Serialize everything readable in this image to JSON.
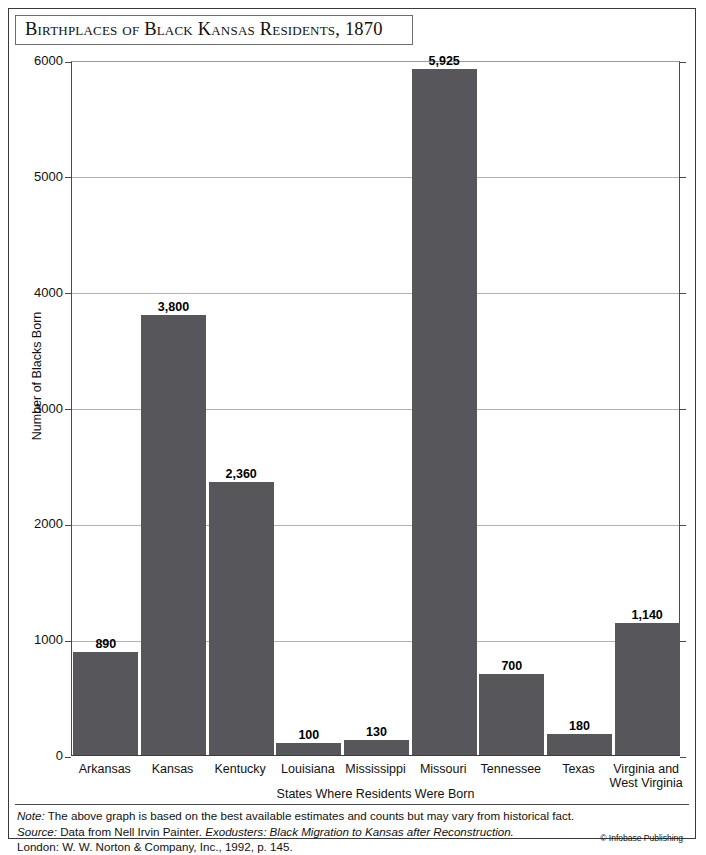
{
  "figure": {
    "title": "Birthplaces of Black Kansas Residents, 1870"
  },
  "chart_data": {
    "type": "bar",
    "title": "Birthplaces of Black Kansas Residents, 1870",
    "xlabel": "States Where Residents Were Born",
    "ylabel": "Number of Blacks Born",
    "categories": [
      "Arkansas",
      "Kansas",
      "Kentucky",
      "Louisiana",
      "Mississippi",
      "Missouri",
      "Tennessee",
      "Texas",
      "Virginia and West Virginia"
    ],
    "values": [
      890,
      3800,
      2360,
      100,
      130,
      5925,
      700,
      180,
      1140
    ],
    "value_labels": [
      "890",
      "3,800",
      "2,360",
      "100",
      "130",
      "5,925",
      "700",
      "180",
      "1,140"
    ],
    "category_lines": [
      [
        "Arkansas"
      ],
      [
        "Kansas"
      ],
      [
        "Kentucky"
      ],
      [
        "Louisiana"
      ],
      [
        "Mississippi"
      ],
      [
        "Missouri"
      ],
      [
        "Tennessee"
      ],
      [
        "Texas"
      ],
      [
        "Virginia and",
        "West Virginia"
      ]
    ],
    "ylim": [
      0,
      6000
    ],
    "yticks": [
      0,
      1000,
      2000,
      3000,
      4000,
      5000,
      6000
    ],
    "ytick_labels": [
      "0",
      "1000",
      "2000",
      "3000",
      "4000",
      "5000",
      "6000"
    ],
    "grid": true,
    "legend": false,
    "bar_color": "#57565a",
    "gridline_color": "#b2b2b2",
    "axis_color": "#4a4a4a"
  },
  "footer": {
    "note_label": "Note:",
    "note_text": " The above graph is based on the best available estimates and counts but may vary from historical fact.",
    "source_label": "Source:",
    "source_text_1": " Data from Nell Irvin Painter. ",
    "source_italic": "Exodusters: Black Migration to Kansas after Reconstruction.",
    "source_line_2": "London: W. W. Norton & Company, Inc., 1992, p. 145.",
    "copyright": "© Infobase Publishing"
  }
}
